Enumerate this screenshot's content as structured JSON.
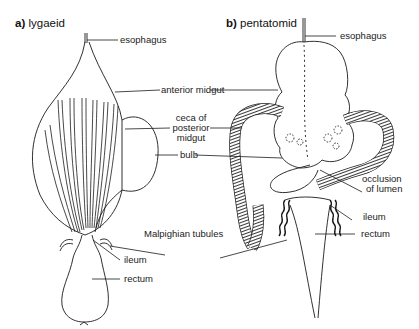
{
  "panel_a": {
    "letter": "a)",
    "title": "lygaeid",
    "labels": {
      "esophagus": "esophagus",
      "anterior_midgut": "anterior midgut",
      "ceca_line1": "ceca of",
      "ceca_line2": "posterior",
      "ceca_line3": "midgut",
      "bulb": "bulb",
      "malpighian": "Malpighian tubules",
      "ileum": "ileum",
      "rectum": "rectum"
    }
  },
  "panel_b": {
    "letter": "b)",
    "title": "pentatomid",
    "labels": {
      "esophagus": "esophagus",
      "occlusion_line1": "occlusion",
      "occlusion_line2": "of lumen",
      "ileum": "ileum",
      "rectum": "rectum"
    }
  },
  "colors": {
    "ink": "#1a1a1a",
    "background": "#ffffff",
    "hatch": "#3a3a3a"
  }
}
